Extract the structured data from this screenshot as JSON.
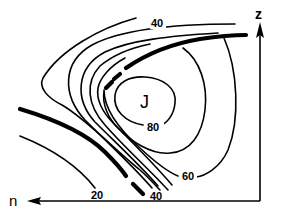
{
  "diagram": {
    "type": "jet stream cross-section (isotach contours)",
    "axes": {
      "vertical_label": "z",
      "horizontal_label": "n"
    },
    "core_label": "J",
    "contour_labels": {
      "top_40": "40",
      "bottom_40": "40",
      "c60": "60",
      "c80": "80",
      "c20": "20"
    },
    "colors": {
      "line": "#000000",
      "background": "#ffffff"
    }
  }
}
